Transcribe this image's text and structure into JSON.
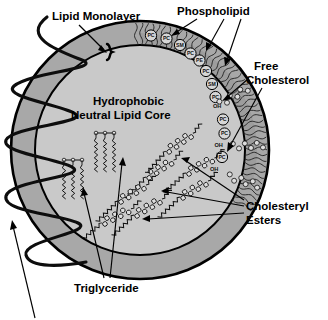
{
  "figure": {
    "labels": {
      "lipid_monolayer": "Lipid Monolayer",
      "phospholipid": "Phospholipid",
      "free_cholesterol_line1": "Free",
      "free_cholesterol_line2": "Cholesterol",
      "core_line1": "Hydrophobic",
      "core_line2": "Neutral Lipid Core",
      "cholesteryl_esters_line1": "Cholesteryl",
      "cholesteryl_esters_line2": "Esters",
      "triglyceride": "Triglyceride"
    },
    "colors": {
      "background": "#ffffff",
      "outer_shell": "#a8a8a8",
      "core_fill": "#c9c9c9",
      "monolayer_band": "#9a9a9a",
      "outline": "#000000",
      "headgroup_fill": "#d6d6d6",
      "text": "#000000"
    },
    "headgroups": [
      {
        "id": "hg-1",
        "text": "PC",
        "cx": 151.0,
        "cy": 35.5
      },
      {
        "id": "hg-2",
        "text": "PC",
        "cx": 166.5,
        "cy": 38.5
      },
      {
        "id": "hg-3",
        "text": "SM",
        "cx": 180.0,
        "cy": 45.0
      },
      {
        "id": "hg-4",
        "text": "PC",
        "cx": 190.5,
        "cy": 53.5
      },
      {
        "id": "hg-5",
        "text": "PE",
        "cx": 199.5,
        "cy": 60.5
      },
      {
        "id": "hg-6",
        "text": "PC",
        "cx": 206.0,
        "cy": 71.0
      },
      {
        "id": "hg-7",
        "text": "SM",
        "cx": 212.0,
        "cy": 84.0
      },
      {
        "id": "hg-8",
        "text": "PC",
        "cx": 215.5,
        "cy": 97.0
      },
      {
        "id": "hg-9",
        "text": "PC",
        "cx": 223.0,
        "cy": 119.5
      },
      {
        "id": "hg-10",
        "text": "PC",
        "cx": 224.5,
        "cy": 133.5
      },
      {
        "id": "hg-11",
        "text": "PC",
        "cx": 222.0,
        "cy": 157.0
      }
    ],
    "cholesterol_oh": [
      {
        "id": "oh-1",
        "text": "OH",
        "x": 213.0,
        "y": 108.0
      },
      {
        "id": "oh-2",
        "text": "OH",
        "x": 214.5,
        "y": 147.0
      },
      {
        "id": "oh-3",
        "text": "OH",
        "x": 210.0,
        "y": 171.0
      }
    ],
    "annotations": [
      {
        "id": "ann-lipid-monolayer",
        "label": "Lipid Monolayer",
        "arrows": 1
      },
      {
        "id": "ann-phospholipid",
        "label": "Phospholipid",
        "arrows": 3
      },
      {
        "id": "ann-free-cholesterol",
        "label": "Free Cholesterol",
        "arrows": 2
      },
      {
        "id": "ann-cholesteryl-esters",
        "label": "Cholesteryl Esters",
        "arrows": 3
      },
      {
        "id": "ann-triglyceride",
        "label": "Triglyceride",
        "arrows": 2
      },
      {
        "id": "ann-apolipoprotein",
        "label": "",
        "arrows": 1
      }
    ]
  }
}
